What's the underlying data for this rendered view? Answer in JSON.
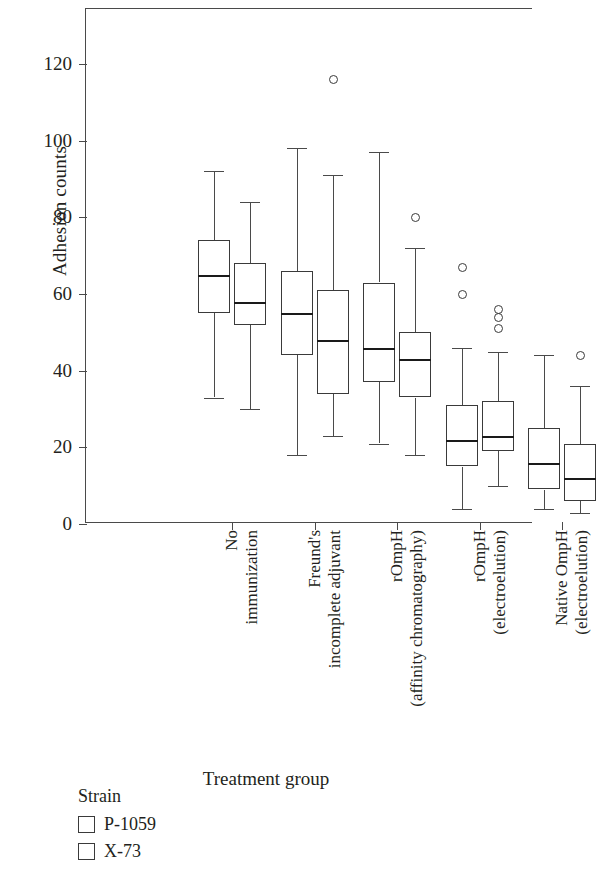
{
  "chart_data": {
    "type": "box",
    "title": "",
    "xlabel": "Treatment group",
    "ylabel": "Adhesion counts",
    "ylim": [
      0,
      133
    ],
    "yticks": [
      0,
      20,
      40,
      60,
      80,
      100,
      120
    ],
    "ytick_labels": [
      "0",
      "20",
      "40",
      "60",
      "80",
      "100",
      "120"
    ],
    "grid": false,
    "legend": {
      "title": "Strain",
      "position": "bottom-left",
      "entries": [
        {
          "label": "P-1059",
          "fill": "#ffffff",
          "stroke": "#3a3a3a"
        },
        {
          "label": "X-73",
          "fill": "#ffffff",
          "stroke": "#3a3a3a"
        }
      ]
    },
    "categories": [
      "No immunization",
      "Freund's incomplete adjuvant",
      "rOmpH (affinity chromatography)",
      "rOmpH (electroelution)",
      "Native OmpH (electroelution)"
    ],
    "category_label_lines": [
      [
        "No",
        "immunization"
      ],
      [
        "Freund's",
        "incomplete adjuvant"
      ],
      [
        "rOmpH",
        "(affinity chromatography)"
      ],
      [
        "rOmpH",
        "(electroelution)"
      ],
      [
        "Native OmpH",
        "(electroelution)"
      ]
    ],
    "series": [
      {
        "name": "P-1059",
        "boxes": [
          {
            "category": "No immunization",
            "whisker_low": 33,
            "q1": 55,
            "median": 65,
            "q3": 74,
            "whisker_high": 92,
            "outliers": []
          },
          {
            "category": "Freund's incomplete adjuvant",
            "whisker_low": 18,
            "q1": 44,
            "median": 55,
            "q3": 66,
            "whisker_high": 98,
            "outliers": []
          },
          {
            "category": "rOmpH (affinity chromatography)",
            "whisker_low": 21,
            "q1": 37,
            "median": 46,
            "q3": 63,
            "whisker_high": 97,
            "outliers": []
          },
          {
            "category": "rOmpH (electroelution)",
            "whisker_low": 4,
            "q1": 15,
            "median": 22,
            "q3": 31,
            "whisker_high": 46,
            "outliers": [
              67,
              60
            ]
          },
          {
            "category": "Native OmpH (electroelution)",
            "whisker_low": 4,
            "q1": 9,
            "median": 16,
            "q3": 25,
            "whisker_high": 44,
            "outliers": []
          }
        ]
      },
      {
        "name": "X-73",
        "boxes": [
          {
            "category": "No immunization",
            "whisker_low": 30,
            "q1": 52,
            "median": 58,
            "q3": 68,
            "whisker_high": 84,
            "outliers": []
          },
          {
            "category": "Freund's incomplete adjuvant",
            "whisker_low": 23,
            "q1": 34,
            "median": 48,
            "q3": 61,
            "whisker_high": 91,
            "outliers": [
              116
            ]
          },
          {
            "category": "rOmpH (affinity chromatography)",
            "whisker_low": 18,
            "q1": 33,
            "median": 43,
            "q3": 50,
            "whisker_high": 72,
            "outliers": [
              80
            ]
          },
          {
            "category": "rOmpH (electroelution)",
            "whisker_low": 10,
            "q1": 19,
            "median": 23,
            "q3": 32,
            "whisker_high": 45,
            "outliers": [
              56,
              54,
              51
            ]
          },
          {
            "category": "Native OmpH (electroelution)",
            "whisker_low": 3,
            "q1": 6,
            "median": 12,
            "q3": 21,
            "whisker_high": 36,
            "outliers": [
              44
            ]
          }
        ]
      }
    ]
  },
  "axis": {
    "y_title": "Adhesion counts",
    "x_title": "Treatment group"
  },
  "legend": {
    "title": "Strain",
    "items": [
      {
        "label": "P-1059"
      },
      {
        "label": "X-73"
      }
    ]
  },
  "colors": {
    "axis": "#4a4a4a",
    "box_stroke": "#3a3a3a",
    "median": "#1a1a1a",
    "background": "#ffffff"
  }
}
